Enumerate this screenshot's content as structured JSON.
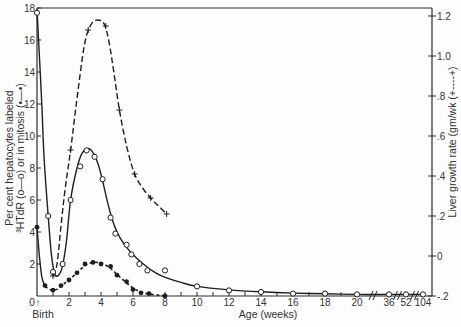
{
  "chart_data": {
    "type": "line",
    "title": "",
    "xlabel": "Age (weeks)",
    "x_origin_label": "Birth",
    "x_origin_arrow": "↑",
    "ylabel_left": {
      "line1": "Per cent hepatocytes labeled",
      "line2": "³HTdR (o—o) or in mitosis (•—•)"
    },
    "ylabel_right": "Liver growth rate (gm/wk (+----+)",
    "x_ticks": [
      {
        "value": 0,
        "label": "0"
      },
      {
        "value": 2,
        "label": "2"
      },
      {
        "value": 4,
        "label": "4"
      },
      {
        "value": 6,
        "label": "6"
      },
      {
        "value": 8,
        "label": "8"
      },
      {
        "value": 10,
        "label": "10"
      },
      {
        "value": 12,
        "label": "12"
      },
      {
        "value": 14,
        "label": "14"
      },
      {
        "value": 16,
        "label": "16"
      },
      {
        "value": 18,
        "label": "18"
      },
      {
        "value": 20,
        "label": "20"
      },
      {
        "value": 36,
        "label": "36"
      },
      {
        "value": 52,
        "label": "52"
      },
      {
        "value": 104,
        "label": "104"
      }
    ],
    "axis_breaks": [
      [
        20,
        36
      ],
      [
        36,
        52
      ],
      [
        52,
        104
      ]
    ],
    "y_left_ticks": [
      {
        "value": 2,
        "label": "2"
      },
      {
        "value": 4,
        "label": "4"
      },
      {
        "value": 6,
        "label": "6"
      },
      {
        "value": 8,
        "label": "8"
      },
      {
        "value": 10,
        "label": "10"
      },
      {
        "value": 12,
        "label": "12"
      },
      {
        "value": 14,
        "label": "14"
      },
      {
        "value": 16,
        "label": "16"
      },
      {
        "value": 18,
        "label": "18"
      }
    ],
    "y_right_ticks": [
      {
        "value": 1.2,
        "label": "1.2"
      },
      {
        "value": 1.0,
        "label": "1.0"
      },
      {
        "value": 0.8,
        "label": ".8"
      },
      {
        "value": 0.6,
        "label": ".6"
      },
      {
        "value": 0.4,
        "label": ".4"
      },
      {
        "value": 0.2,
        "label": ".2"
      },
      {
        "value": 0.0,
        "label": "0"
      },
      {
        "value": -0.2,
        "label": "-.2"
      }
    ],
    "xlim": [
      0,
      104
    ],
    "ylim_left": [
      0,
      18
    ],
    "ylim_right": [
      -0.2,
      1.2
    ],
    "grid": false,
    "legend": "none (series identified by symbols in axis titles)",
    "series": [
      {
        "name": "³HTdR labeled hepatocytes (%)",
        "axis": "left",
        "marker": "open-circle",
        "line": "solid",
        "points": [
          [
            0,
            17.7
          ],
          [
            0.7,
            5.0
          ],
          [
            1.0,
            1.5
          ],
          [
            1.6,
            2.0
          ],
          [
            2.1,
            6.0
          ],
          [
            2.7,
            8.1
          ],
          [
            3.1,
            9.1
          ],
          [
            3.6,
            8.7
          ],
          [
            4.1,
            7.3
          ],
          [
            4.6,
            4.9
          ],
          [
            4.9,
            3.9
          ],
          [
            5.6,
            3.2
          ],
          [
            5.9,
            2.6
          ],
          [
            6.4,
            2.0
          ],
          [
            6.9,
            1.6
          ],
          [
            8.0,
            1.6
          ],
          [
            10,
            0.6
          ],
          [
            12,
            0.35
          ],
          [
            14,
            0.25
          ],
          [
            16,
            0.15
          ],
          [
            18,
            0.15
          ],
          [
            20,
            0.1
          ],
          [
            36,
            0.1
          ],
          [
            52,
            0.1
          ],
          [
            104,
            0.1
          ]
        ],
        "curve": [
          [
            0,
            17.9
          ],
          [
            0.15,
            15.0
          ],
          [
            0.3,
            12.0
          ],
          [
            0.45,
            8.5
          ],
          [
            0.7,
            5.0
          ],
          [
            0.9,
            2.6
          ],
          [
            1.1,
            1.4
          ],
          [
            1.35,
            1.3
          ],
          [
            1.6,
            1.9
          ],
          [
            1.85,
            3.5
          ],
          [
            2.1,
            6.0
          ],
          [
            2.5,
            8.0
          ],
          [
            2.8,
            8.9
          ],
          [
            3.1,
            9.2
          ],
          [
            3.4,
            9.1
          ],
          [
            3.8,
            8.3
          ],
          [
            4.1,
            7.2
          ],
          [
            4.4,
            5.9
          ],
          [
            4.7,
            4.8
          ],
          [
            5.0,
            4.0
          ],
          [
            5.4,
            3.3
          ],
          [
            5.8,
            2.8
          ],
          [
            6.3,
            2.3
          ],
          [
            6.9,
            1.8
          ],
          [
            7.5,
            1.4
          ],
          [
            8.2,
            1.1
          ],
          [
            9.0,
            0.85
          ],
          [
            10,
            0.6
          ],
          [
            12,
            0.38
          ],
          [
            14,
            0.26
          ],
          [
            16,
            0.18
          ],
          [
            18,
            0.14
          ],
          [
            20,
            0.1
          ],
          [
            36,
            0.1
          ],
          [
            52,
            0.1
          ],
          [
            104,
            0.1
          ]
        ]
      },
      {
        "name": "Hepatocytes in mitosis (%)",
        "axis": "left",
        "marker": "filled-circle",
        "line": "dotted",
        "solid_until": 0.5,
        "points": [
          [
            0,
            4.3
          ],
          [
            0.5,
            0.65
          ],
          [
            1.0,
            0.37
          ],
          [
            1.5,
            0.65
          ],
          [
            2.0,
            1.0
          ],
          [
            2.5,
            1.45
          ],
          [
            3.0,
            2.0
          ],
          [
            3.5,
            2.1
          ],
          [
            4.0,
            2.0
          ],
          [
            4.6,
            1.85
          ],
          [
            5.0,
            1.3
          ],
          [
            5.6,
            0.9
          ],
          [
            6.0,
            0.4
          ],
          [
            6.5,
            0.2
          ],
          [
            7.0,
            0.15
          ],
          [
            8.0,
            0.0
          ]
        ],
        "curve": [
          [
            0,
            4.3
          ],
          [
            0.15,
            2.5
          ],
          [
            0.3,
            1.2
          ],
          [
            0.5,
            0.6
          ],
          [
            0.8,
            0.4
          ],
          [
            1.0,
            0.35
          ],
          [
            1.3,
            0.45
          ],
          [
            1.6,
            0.7
          ],
          [
            2.0,
            1.0
          ],
          [
            2.5,
            1.45
          ],
          [
            3.0,
            1.9
          ],
          [
            3.5,
            2.1
          ],
          [
            4.0,
            2.05
          ],
          [
            4.5,
            1.8
          ],
          [
            5.0,
            1.35
          ],
          [
            5.5,
            0.9
          ],
          [
            6.0,
            0.5
          ],
          [
            6.5,
            0.25
          ],
          [
            7.0,
            0.12
          ],
          [
            8.0,
            0.0
          ]
        ]
      },
      {
        "name": "Liver growth rate (gm/wk)",
        "axis": "right",
        "marker": "cross",
        "line": "dashed",
        "points": [
          [
            1.0,
            -0.1
          ],
          [
            2.1,
            0.53
          ],
          [
            3.2,
            1.13
          ],
          [
            4.3,
            1.15
          ],
          [
            5.15,
            0.73
          ],
          [
            6.1,
            0.41
          ],
          [
            7.1,
            0.29
          ],
          [
            8.1,
            0.21
          ]
        ],
        "curve": [
          [
            1.0,
            -0.1
          ],
          [
            1.25,
            -0.04
          ],
          [
            1.5,
            0.15
          ],
          [
            1.75,
            0.33
          ],
          [
            2.1,
            0.53
          ],
          [
            2.6,
            0.85
          ],
          [
            3.0,
            1.07
          ],
          [
            3.4,
            1.16
          ],
          [
            3.8,
            1.18
          ],
          [
            4.2,
            1.16
          ],
          [
            4.5,
            1.07
          ],
          [
            4.8,
            0.92
          ],
          [
            5.15,
            0.73
          ],
          [
            5.6,
            0.55
          ],
          [
            6.1,
            0.41
          ],
          [
            6.6,
            0.34
          ],
          [
            7.1,
            0.29
          ],
          [
            7.6,
            0.25
          ],
          [
            8.1,
            0.21
          ]
        ]
      }
    ]
  }
}
